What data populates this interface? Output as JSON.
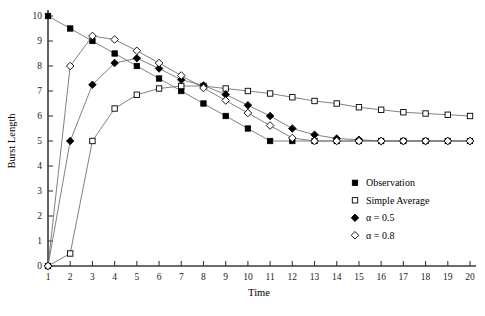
{
  "chart_data": {
    "type": "line",
    "title": "",
    "xlabel": "Time",
    "ylabel": "Burst Length",
    "xlim": [
      1,
      20
    ],
    "ylim": [
      0,
      10
    ],
    "grid": false,
    "legend_position": "bottom-right",
    "x": [
      1,
      2,
      3,
      4,
      5,
      6,
      7,
      8,
      9,
      10,
      11,
      12,
      13,
      14,
      15,
      16,
      17,
      18,
      19,
      20
    ],
    "xticks": [
      "1",
      "2",
      "3",
      "4",
      "5",
      "6",
      "7",
      "8",
      "9",
      "10",
      "11",
      "12",
      "13",
      "14",
      "15",
      "16",
      "17",
      "18",
      "19",
      "20"
    ],
    "yticks": [
      "0",
      "1",
      "2",
      "3",
      "4",
      "5",
      "6",
      "7",
      "8",
      "9",
      "10"
    ],
    "series": [
      {
        "name": "Observation",
        "marker": "filled-square",
        "values": [
          10,
          9.5,
          9,
          8.5,
          8,
          7.5,
          7,
          6.5,
          6,
          5.5,
          5,
          5,
          5,
          5,
          5,
          5,
          5,
          5,
          5,
          5
        ]
      },
      {
        "name": "Simple Average",
        "marker": "open-square",
        "values": [
          0,
          0.5,
          5,
          6.3,
          6.85,
          7.1,
          7.2,
          7.2,
          7.1,
          7,
          6.9,
          6.75,
          6.6,
          6.5,
          6.35,
          6.25,
          6.15,
          6.1,
          6.05,
          6
        ]
      },
      {
        "name": "α = 0.5",
        "marker": "filled-diamond",
        "values": [
          0,
          5,
          7.25,
          8.12,
          8.31,
          7.9,
          7.45,
          7.22,
          6.86,
          6.43,
          6,
          5.5,
          5.25,
          5.1,
          5.05,
          5,
          5,
          5,
          5,
          5
        ]
      },
      {
        "name": "α = 0.8",
        "marker": "open-diamond",
        "values": [
          0,
          8,
          9.2,
          9.06,
          8.61,
          8.12,
          7.62,
          7.12,
          6.62,
          6.12,
          5.62,
          5.12,
          5,
          5,
          5,
          5,
          5,
          5,
          5,
          5
        ]
      }
    ]
  },
  "legend": {
    "entries": [
      {
        "label": "Observation",
        "marker": "filled-square"
      },
      {
        "label": "Simple Average",
        "marker": "open-square"
      },
      {
        "label": "α = 0.5",
        "marker": "filled-diamond"
      },
      {
        "label": "α = 0.8",
        "marker": "open-diamond"
      }
    ]
  }
}
